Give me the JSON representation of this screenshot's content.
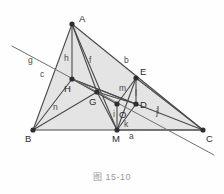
{
  "figure": {
    "caption": "图 15-10",
    "colors": {
      "fill": "#e4e4e4",
      "fill_dark": "#dcdcdc",
      "stroke": "#4a4a4a",
      "stroke_light": "#6f6f6f",
      "point": "#2e2e2e",
      "label": "#3a3a3a",
      "caption": "#9a9a9a",
      "background": "#fefefe"
    },
    "points": [
      {
        "id": "A",
        "label": "A",
        "x": 72,
        "y": 24,
        "lx": 79,
        "ly": 14
      },
      {
        "id": "B",
        "label": "B",
        "x": 33,
        "y": 130,
        "lx": 25,
        "ly": 134
      },
      {
        "id": "C",
        "label": "C",
        "x": 203,
        "y": 130,
        "lx": 206,
        "ly": 134
      },
      {
        "id": "H",
        "label": "H",
        "x": 72,
        "y": 79,
        "lx": 64,
        "ly": 84
      },
      {
        "id": "G",
        "label": "G",
        "x": 97,
        "y": 92,
        "lx": 89,
        "ly": 97
      },
      {
        "id": "E",
        "label": "E",
        "x": 136,
        "y": 78,
        "lx": 140,
        "ly": 67
      },
      {
        "id": "D",
        "label": "D",
        "x": 136,
        "y": 104,
        "lx": 140,
        "ly": 100
      },
      {
        "id": "O",
        "label": "O",
        "x": 117,
        "y": 104,
        "lx": 119,
        "ly": 110
      },
      {
        "id": "M",
        "label": "M",
        "x": 117,
        "y": 130,
        "lx": 112,
        "ly": 134
      }
    ],
    "segment_labels": [
      {
        "id": "a",
        "label": "a",
        "x": 129,
        "y": 132
      },
      {
        "id": "b",
        "label": "b",
        "x": 124,
        "y": 56
      },
      {
        "id": "c",
        "label": "c",
        "x": 40,
        "y": 70
      },
      {
        "id": "f",
        "label": "f",
        "x": 89,
        "y": 56
      },
      {
        "id": "g",
        "label": "g",
        "x": 28,
        "y": 56
      },
      {
        "id": "h",
        "label": "h",
        "x": 64,
        "y": 54
      },
      {
        "id": "i",
        "label": "i",
        "x": 113,
        "y": 110
      },
      {
        "id": "j",
        "label": "j",
        "x": 156,
        "y": 108
      },
      {
        "id": "k",
        "label": "k",
        "x": 124,
        "y": 120
      },
      {
        "id": "l",
        "label": "l",
        "x": 135,
        "y": 89
      },
      {
        "id": "m",
        "label": "m",
        "x": 119,
        "y": 84
      },
      {
        "id": "n",
        "label": "n",
        "x": 53,
        "y": 103
      }
    ],
    "shapes": {
      "triangle_abc": "33,130 72,24 203,130",
      "triangle_aec": "72,24 136,78 203,130",
      "line_g": {
        "x1": 12,
        "y1": 46,
        "x2": 214,
        "y2": 155
      },
      "edges": [
        {
          "name": "AB",
          "x1": 72,
          "y1": 24,
          "x2": 33,
          "y2": 130
        },
        {
          "name": "AC",
          "x1": 72,
          "y1": 24,
          "x2": 203,
          "y2": 130
        },
        {
          "name": "BC",
          "x1": 33,
          "y1": 130,
          "x2": 203,
          "y2": 130
        },
        {
          "name": "AH",
          "x1": 72,
          "y1": 24,
          "x2": 72,
          "y2": 79
        },
        {
          "name": "AG",
          "x1": 72,
          "y1": 24,
          "x2": 97,
          "y2": 92
        },
        {
          "name": "AM",
          "x1": 72,
          "y1": 24,
          "x2": 117,
          "y2": 130
        },
        {
          "name": "BH",
          "x1": 33,
          "y1": 130,
          "x2": 72,
          "y2": 79
        },
        {
          "name": "BG",
          "x1": 33,
          "y1": 130,
          "x2": 97,
          "y2": 92
        },
        {
          "name": "HD",
          "x1": 72,
          "y1": 79,
          "x2": 136,
          "y2": 104
        },
        {
          "name": "HC",
          "x1": 72,
          "y1": 79,
          "x2": 203,
          "y2": 130
        },
        {
          "name": "HO",
          "x1": 72,
          "y1": 79,
          "x2": 117,
          "y2": 104
        },
        {
          "name": "ED",
          "x1": 136,
          "y1": 78,
          "x2": 136,
          "y2": 104
        },
        {
          "name": "EM",
          "x1": 136,
          "y1": 78,
          "x2": 117,
          "y2": 130
        },
        {
          "name": "EO",
          "x1": 136,
          "y1": 78,
          "x2": 117,
          "y2": 104
        },
        {
          "name": "DM",
          "x1": 136,
          "y1": 104,
          "x2": 117,
          "y2": 130
        },
        {
          "name": "OM",
          "x1": 117,
          "y1": 104,
          "x2": 117,
          "y2": 130
        },
        {
          "name": "GM",
          "x1": 97,
          "y1": 92,
          "x2": 117,
          "y2": 130
        },
        {
          "name": "GD",
          "x1": 97,
          "y1": 92,
          "x2": 136,
          "y2": 104
        },
        {
          "name": "MC",
          "x1": 117,
          "y1": 130,
          "x2": 203,
          "y2": 130
        },
        {
          "name": "EC",
          "x1": 136,
          "y1": 78,
          "x2": 203,
          "y2": 130
        }
      ],
      "tick_mark": {
        "x": 158,
        "y": 110
      }
    }
  }
}
